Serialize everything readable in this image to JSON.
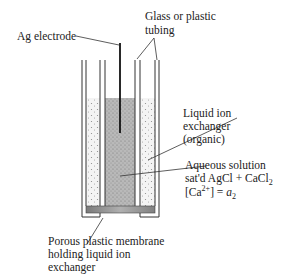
{
  "diagram": {
    "type": "ion-selective electrode cross-section",
    "labels": {
      "ag_electrode": "Ag electrode",
      "tubing_line1": "Glass or plastic",
      "tubing_line2": "tubing",
      "ion_exchanger_line1": "Liquid ion",
      "ion_exchanger_line2": "exchanger",
      "ion_exchanger_line3": "(organic)",
      "aqueous_line1": "Aqueous solution",
      "aqueous_line2_prefix": "sat'd AgCl + CaCl",
      "aqueous_line2_sub": "2",
      "aqueous_line3_prefix": "[Ca",
      "aqueous_line3_sup": "2+",
      "aqueous_line3_mid": "] = ",
      "aqueous_line3_var": "a",
      "aqueous_line3_sub": "2",
      "membrane_line1": "Porous plastic membrane",
      "membrane_line2": "holding liquid ion",
      "membrane_line3": "exchanger"
    },
    "colors": {
      "line": "#333333",
      "aqueous_fill": "#b8b8b8",
      "exchanger_fill": "#f2f2f2",
      "membrane_fill": "#8a8a8a"
    }
  }
}
